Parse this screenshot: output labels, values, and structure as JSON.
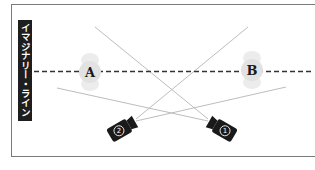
{
  "title_label": "イマジナリー・ライン",
  "subjects": [
    {
      "id": "A",
      "label": "A",
      "cx": 90,
      "cy": 72
    },
    {
      "id": "B",
      "label": "B",
      "cx": 252,
      "cy": 70
    }
  ],
  "cameras": [
    {
      "id": "camera-1",
      "label": "①",
      "cx": 222,
      "cy": 128,
      "rotation": 30
    },
    {
      "id": "camera-2",
      "label": "②",
      "cx": 122,
      "cy": 128,
      "rotation": -30
    }
  ],
  "colors": {
    "frame": "#7a7a7a",
    "label_bg": "#1e1e1e",
    "camera": "#1a1a1a",
    "sight_line": "#bdbdbd",
    "dashed_line": "#333333",
    "subject_ghost": "#e6e6e6"
  }
}
